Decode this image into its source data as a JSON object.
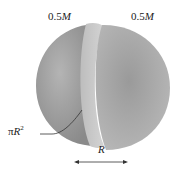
{
  "diagram": {
    "labels": {
      "left_mass": "0.5",
      "left_mass_unit": "M",
      "right_mass": "0.5",
      "right_mass_unit": "M",
      "area_prefix": "π",
      "area_var": "R",
      "area_exp": "2",
      "radius": "R"
    },
    "colors": {
      "sphere": "#9a9a9a",
      "cross_section": "#c8c8c8",
      "text": "#222222"
    }
  }
}
